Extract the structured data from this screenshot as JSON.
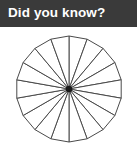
{
  "header": {
    "title": "Did you know?",
    "background_color": "#3a3a3a",
    "text_color": "#ffffff"
  },
  "figure": {
    "name": "fraction-circle-diagram",
    "background_color": "#ffffff",
    "stroke_color": "#4a4a4a",
    "fill_color": "#ffffff",
    "center_dot_color": "#1a1a1a",
    "segment_count": 18,
    "center_x": 69,
    "center_y": 62,
    "radius": 53,
    "start_angle_deg": -90,
    "center_dot_radius": 3.2,
    "stroke_width": 1
  }
}
